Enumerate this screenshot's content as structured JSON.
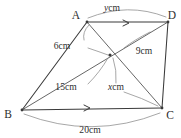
{
  "figure": {
    "background_color": "#ffffff",
    "line_color": "#3a3a3a",
    "leader_color": "#8a8a8a",
    "text_color": "#2e2e2e"
  },
  "vertices": [
    {
      "id": "A",
      "label": "A",
      "x": 87,
      "y": 22
    },
    {
      "id": "D",
      "label": "D",
      "x": 168,
      "y": 22
    },
    {
      "id": "B",
      "label": "B",
      "x": 22,
      "y": 110
    },
    {
      "id": "C",
      "label": "C",
      "x": 162,
      "y": 108
    }
  ],
  "intersection": {
    "id": "P",
    "x": 110,
    "y": 55
  },
  "vertex_labels": {
    "A": {
      "text": "A",
      "x": 76,
      "y": 19
    },
    "D": {
      "text": "D",
      "x": 170,
      "y": 19
    },
    "B": {
      "text": "B",
      "x": 8,
      "y": 118
    },
    "C": {
      "text": "C",
      "x": 166,
      "y": 118
    }
  },
  "dimensions": [
    {
      "name": "AD",
      "value": "y",
      "unit": "cm",
      "label": "y cm",
      "label_x": 112,
      "label_y": 11,
      "italic_var": true
    },
    {
      "name": "AP",
      "value": "6",
      "unit": "cm",
      "label": "6 cm",
      "label_x": 60,
      "label_y": 46,
      "italic_var": false
    },
    {
      "name": "PD",
      "value": "9",
      "unit": "cm",
      "label": "9 cm",
      "label_x": 127,
      "label_y": 52,
      "italic_var": false
    },
    {
      "name": "BP",
      "value": "15",
      "unit": "cm",
      "label": "15 cm",
      "label_x": 57,
      "label_y": 91,
      "italic_var": false
    },
    {
      "name": "PC",
      "value": "x",
      "unit": "cm",
      "label": "x cm",
      "label_x": 110,
      "label_y": 91,
      "italic_var": true
    },
    {
      "name": "BC",
      "value": "20",
      "unit": "cm",
      "label": "20 cm",
      "label_x": 72,
      "label_y": 132,
      "italic_var": false
    }
  ],
  "parallel_marks": [
    {
      "on": "AD",
      "x": 127,
      "y": 24
    },
    {
      "on": "BC",
      "x": 88,
      "y": 109
    }
  ],
  "edges": [
    {
      "from": "A",
      "to": "D",
      "type": "side"
    },
    {
      "from": "B",
      "to": "C",
      "type": "side"
    },
    {
      "from": "A",
      "to": "B",
      "type": "side"
    },
    {
      "from": "D",
      "to": "C",
      "type": "side"
    },
    {
      "from": "A",
      "to": "C",
      "type": "diagonal"
    },
    {
      "from": "B",
      "to": "D",
      "type": "diagonal"
    }
  ]
}
